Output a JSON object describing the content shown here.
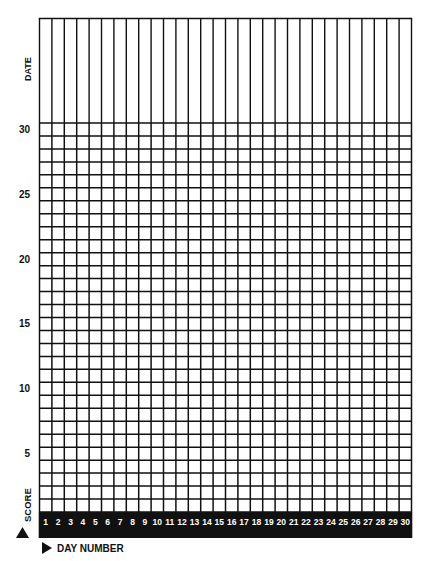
{
  "chart_data": {
    "type": "table",
    "title": "",
    "grid": true,
    "xlabel": "DAY NUMBER",
    "ylabel": "SCORE",
    "header_row_label": "DATE",
    "x": [
      1,
      2,
      3,
      4,
      5,
      6,
      7,
      8,
      9,
      10,
      11,
      12,
      13,
      14,
      15,
      16,
      17,
      18,
      19,
      20,
      21,
      22,
      23,
      24,
      25,
      26,
      27,
      28,
      29,
      30
    ],
    "y_rows": 30,
    "ylim": [
      0,
      30
    ],
    "y_tick_labels": [
      "5",
      "10",
      "15",
      "20",
      "25",
      "30"
    ],
    "y_tick_values": [
      5,
      10,
      15,
      20,
      25,
      30
    ],
    "series": [],
    "colors": {
      "line": "#111111",
      "band": "#111111",
      "band_text": "#ffffff",
      "background": "#ffffff"
    }
  },
  "labels": {
    "date": "DATE",
    "score": "SCORE",
    "day_number": "DAY NUMBER"
  }
}
